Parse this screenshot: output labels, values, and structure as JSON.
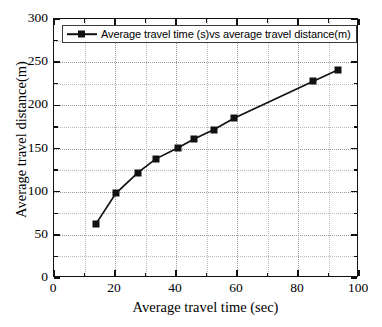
{
  "chart_data": {
    "type": "line",
    "title": "",
    "xlabel": "Average travel time (sec)",
    "ylabel": "Average travel distance(m)",
    "xlim": [
      0,
      100
    ],
    "ylim": [
      0,
      300
    ],
    "xticks": [
      0,
      20,
      40,
      60,
      80,
      100
    ],
    "yticks": [
      0,
      50,
      100,
      150,
      200,
      250,
      300
    ],
    "x_minor_step": 10,
    "y_minor_step": 25,
    "grid": true,
    "legend_position": "top-left",
    "series": [
      {
        "name": "Average travel time (s)vs average travel distance(m)",
        "color": "#111111",
        "marker": "square",
        "x": [
          13.8,
          20.3,
          27.5,
          33.4,
          40.7,
          45.9,
          52.5,
          59.0,
          85.0,
          93.0
        ],
        "y": [
          63,
          98,
          122,
          138,
          151,
          161,
          172,
          185,
          228,
          241
        ]
      }
    ]
  },
  "legend": {
    "entry_label": "Average travel time (s)vs average travel distance(m)"
  },
  "axes": {
    "x_title": "Average travel time (sec)",
    "y_title": "Average travel distance(m)"
  }
}
